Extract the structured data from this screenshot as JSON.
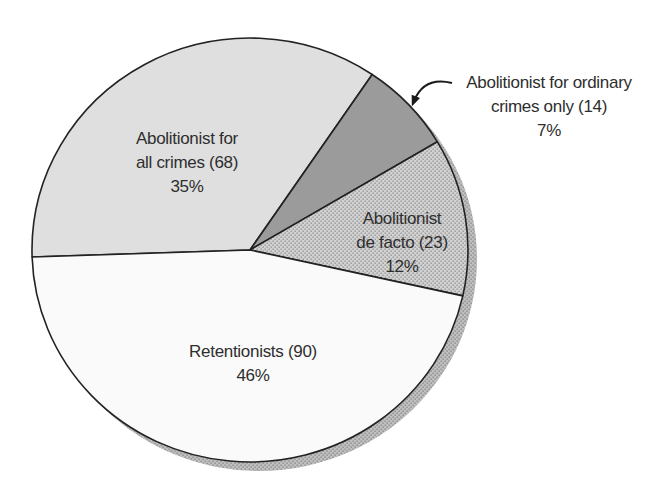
{
  "figure": {
    "background": "#ffffff",
    "width": 668,
    "height": 498
  },
  "chart_data": {
    "type": "pie",
    "title": "",
    "total": 195,
    "legend_position": "none",
    "center": {
      "x": 250,
      "y": 250
    },
    "radius": {
      "rx": 218,
      "ry": 212
    },
    "outline_color": "#222222",
    "outline_width": 1.6,
    "shadow": {
      "dx": 9,
      "dy": 9,
      "base_color": "#c0c0c0",
      "dot_color": "#9a9a9a"
    },
    "categories": [
      "Abolitionist for all crimes",
      "Abolitionist for ordinary crimes only",
      "Abolitionist de facto",
      "Retentionists"
    ],
    "values": [
      68,
      14,
      23,
      90
    ],
    "percents": [
      35,
      7,
      12,
      46
    ],
    "slices": [
      {
        "id": "abolitionist-all-crimes",
        "label": "Abolitionist for all crimes",
        "count": 68,
        "percent": 35,
        "start_deg": 55.9,
        "end_deg": 181.9,
        "fill": "#dfdfdf",
        "label_placement": "inside",
        "label_lines": [
          "Abolitionist for",
          "all crimes (68)",
          "35%"
        ],
        "label_pos": {
          "x": 187,
          "y": 163
        }
      },
      {
        "id": "abolitionist-ordinary-crimes",
        "label": "Abolitionist for ordinary crimes only",
        "count": 14,
        "percent": 7,
        "start_deg": 30.7,
        "end_deg": 55.9,
        "fill": "#9b9b9b",
        "label_placement": "outside-callout",
        "label_lines": [
          "Abolitionist for ordinary",
          "crimes only (14)",
          "7%"
        ],
        "label_pos": {
          "x": 549,
          "y": 107
        }
      },
      {
        "id": "abolitionist-de-facto",
        "label": "Abolitionist de facto",
        "count": 23,
        "percent": 12,
        "start_deg": -12.5,
        "end_deg": 30.7,
        "fill": "halftone",
        "halftone": {
          "base_color": "#d2d2d2",
          "dot_color": "#a2a2a2"
        },
        "label_placement": "inside",
        "label_lines": [
          "Abolitionist",
          "de facto (23)",
          "12%"
        ],
        "label_pos": {
          "x": 402,
          "y": 243
        }
      },
      {
        "id": "retentionists",
        "label": "Retentionists",
        "count": 90,
        "percent": 46,
        "start_deg": 181.9,
        "end_deg": 347.5,
        "fill": "#fafafa",
        "label_placement": "inside",
        "label_lines": [
          "Retentionists (90)",
          "46%"
        ],
        "label_pos": {
          "x": 253,
          "y": 364
        }
      }
    ],
    "callout_arrow": {
      "color": "#1a1a1a",
      "from": {
        "x": 452,
        "y": 83
      },
      "control": {
        "x": 424,
        "y": 76
      },
      "to": {
        "x": 414,
        "y": 101
      }
    }
  }
}
